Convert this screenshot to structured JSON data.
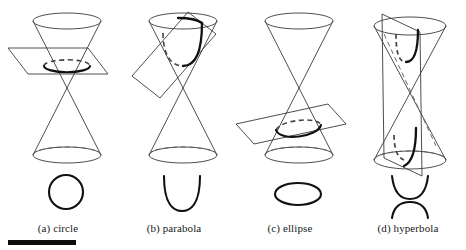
{
  "figure": {
    "background_color": "#ffffff",
    "width": 466,
    "height": 250,
    "line_color": "#3a3a3a",
    "curve_color": "#111111",
    "dashed_color": "#555555",
    "scale_bar": {
      "name": "scale-bar",
      "color": "#0d0d0d",
      "x": 8,
      "y": 240,
      "width": 68,
      "height": 5
    }
  },
  "panels": [
    {
      "id": "circle",
      "label": "(a) circle",
      "conic": "circle",
      "plane_orientation": "horizontal",
      "plane_angle_deg": 0,
      "nappes_cut": 1,
      "cut_nappe": "upper",
      "curve_2d": "closed round loop",
      "x_offset": 0
    },
    {
      "id": "parabola",
      "label": "(b) parabola",
      "conic": "parabola",
      "plane_orientation": "tilted parallel to a generator line",
      "plane_angle_deg": 38,
      "nappes_cut": 1,
      "cut_nappe": "upper",
      "curve_2d": "open U-shaped arc opening upward",
      "x_offset": 116
    },
    {
      "id": "ellipse",
      "label": "(c) ellipse",
      "conic": "ellipse",
      "plane_orientation": "slightly tilted oblique",
      "plane_angle_deg": 14,
      "nappes_cut": 1,
      "cut_nappe": "lower",
      "curve_2d": "closed flattened oval loop",
      "x_offset": 232
    },
    {
      "id": "hyperbola",
      "label": "(d) hyperbola",
      "conic": "hyperbola",
      "plane_orientation": "near vertical, parallel to cone axis",
      "plane_angle_deg": 82,
      "nappes_cut": 2,
      "cut_nappe": "both",
      "curve_2d": "two opposing open arcs, upper opens upward and lower opens downward",
      "x_offset": 350
    }
  ]
}
